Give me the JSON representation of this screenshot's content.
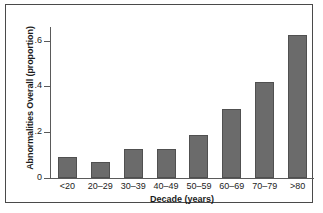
{
  "chart_data": {
    "type": "bar",
    "title": "",
    "xlabel": "Decade (years)",
    "ylabel": "Abnormalities Overall (proportion)",
    "categories": [
      "<20",
      "20–29",
      "30–39",
      "40–49",
      "50–59",
      "60–69",
      "70–79",
      ">80"
    ],
    "values": [
      0.09,
      0.068,
      0.125,
      0.125,
      0.187,
      0.3,
      0.42,
      0.625
    ],
    "ylim": [
      0,
      0.66
    ],
    "yticks": [
      0,
      0.2,
      0.4,
      0.6
    ],
    "ytick_labels": [
      "0",
      ".2",
      ".4",
      ".6"
    ],
    "grid": false,
    "legend": null,
    "bar_color": "#6b6b6b",
    "bar_edge_color": "#505050",
    "axis_color": "#5a5a5a",
    "frame_color": "#4a4a4a",
    "background": "#ffffff"
  }
}
